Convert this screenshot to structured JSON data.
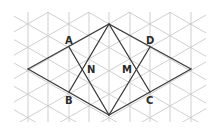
{
  "diagram": {
    "type": "geometry-isometric-grid",
    "grid": {
      "color": "#c9c9c9",
      "vertical_lines_x": [
        8,
        28,
        48,
        69,
        89,
        109,
        130,
        150,
        170,
        191,
        211
      ],
      "row_step": 11.7,
      "clip": {
        "x": 14,
        "y": 12,
        "width": 192,
        "height": 110
      }
    },
    "line_color": "#3a3a3a",
    "vertices": {
      "top": {
        "x": 109,
        "y": 24
      },
      "bottom": {
        "x": 109,
        "y": 115
      },
      "left": {
        "x": 28,
        "y": 69
      },
      "right": {
        "x": 191,
        "y": 69
      },
      "A": {
        "x": 69,
        "y": 47
      },
      "B": {
        "x": 69,
        "y": 92
      },
      "C": {
        "x": 150,
        "y": 92
      },
      "D": {
        "x": 150,
        "y": 47
      },
      "N": {
        "x": 82,
        "y": 69
      },
      "M": {
        "x": 136,
        "y": 69
      }
    },
    "labels": [
      {
        "id": "A",
        "text": "A",
        "x": 65,
        "y": 44
      },
      {
        "id": "B",
        "text": "B",
        "x": 65,
        "y": 104
      },
      {
        "id": "C",
        "text": "C",
        "x": 146,
        "y": 104
      },
      {
        "id": "D",
        "text": "D",
        "x": 146,
        "y": 44
      },
      {
        "id": "N",
        "text": "N",
        "x": 87,
        "y": 73
      },
      {
        "id": "M",
        "text": "M",
        "x": 122,
        "y": 73
      }
    ],
    "segments": [
      [
        "left",
        "top"
      ],
      [
        "top",
        "right"
      ],
      [
        "right",
        "bottom"
      ],
      [
        "bottom",
        "left"
      ],
      [
        "A",
        "bottom"
      ],
      [
        "B",
        "top"
      ],
      [
        "D",
        "bottom"
      ],
      [
        "C",
        "top"
      ],
      [
        "top",
        "bottom"
      ]
    ]
  }
}
